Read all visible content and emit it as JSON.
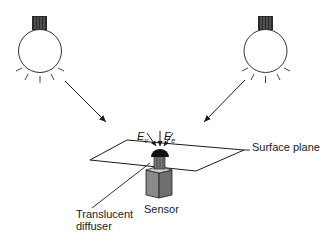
{
  "diagram": {
    "type": "illumination-measurement-setup",
    "labels": {
      "surface_plane": "Surface plane",
      "sensor": "Sensor",
      "diffuser_line1": "Translucent",
      "diffuser_line2": "diffuser"
    },
    "symbols": {
      "ev": {
        "base": "E",
        "sub": "v"
      },
      "ee": {
        "base": "E",
        "sub": "e"
      }
    },
    "components": [
      {
        "id": "light-source-left",
        "kind": "lamp"
      },
      {
        "id": "light-source-right",
        "kind": "lamp"
      },
      {
        "id": "surface-plane",
        "kind": "plane"
      },
      {
        "id": "sensor",
        "kind": "box-with-dome"
      }
    ],
    "colors": {
      "stroke": "#1a1a1a",
      "cap": "#2a2a2a",
      "sensor_box": "#8a8a8a",
      "sensor_box_side": "#6e6e6e",
      "dome": "#111111"
    }
  }
}
